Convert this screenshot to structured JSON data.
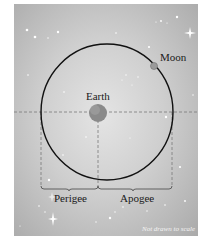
{
  "diagram": {
    "labels": {
      "earth": "Earth",
      "moon": "Moon",
      "perigee": "Perigee",
      "apogee": "Apogee",
      "note": "Not drawn to scale"
    },
    "colors": {
      "background_center": "#e4e4e4",
      "background_edge": "#aaaaaa",
      "orbit": "#111111",
      "dashed_lines": "#7a7a7a",
      "earth": "#8a8a8a",
      "moon": "#9a9a9a",
      "stars": "#ffffff"
    }
  }
}
